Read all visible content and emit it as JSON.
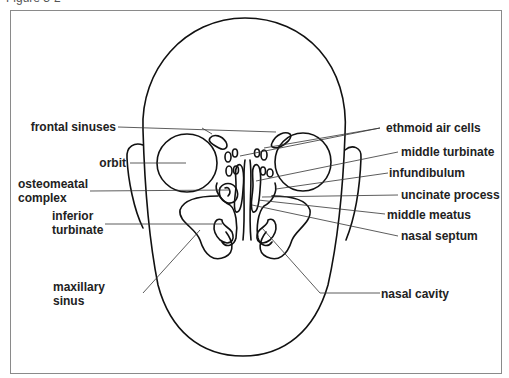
{
  "caption": "Figure 3-2",
  "labels": {
    "frontal_sinuses": "frontal sinuses",
    "orbit": "orbit",
    "osteomeatal_complex_1": "osteomeatal",
    "osteomeatal_complex_2": "complex",
    "inferior_turbinate_1": "inferior",
    "inferior_turbinate_2": "turbinate",
    "maxillary_sinus_1": "maxillary",
    "maxillary_sinus_2": "sinus",
    "ethmoid_air_cells": "ethmoid air cells",
    "middle_turbinate": "middle turbinate",
    "infundibulum": "infundibulum",
    "uncinate_process": "uncinate process",
    "middle_meatus": "middle meatus",
    "nasal_septum": "nasal septum",
    "nasal_cavity": "nasal cavity"
  }
}
